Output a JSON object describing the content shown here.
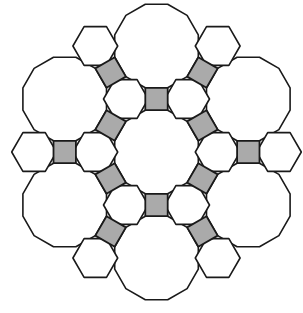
{
  "figure": {
    "vertex_configuration": "4.6.12",
    "edge_length": 22.4,
    "colors": {
      "stroke": "#1a1a1a",
      "square_fill": "#aaaaaa",
      "hexagon_fill": "#ffffff",
      "dodecagon_fill": "#ffffff",
      "background": "#ffffff"
    },
    "center": [
      156.5,
      152
    ],
    "dodecagons": [
      {
        "name": "center",
        "lattice": [
          0,
          0
        ]
      },
      {
        "name": "top",
        "angle_deg": 90
      },
      {
        "name": "upper-right",
        "angle_deg": 30
      },
      {
        "name": "lower-right",
        "angle_deg": -30
      },
      {
        "name": "bottom",
        "angle_deg": -90
      },
      {
        "name": "lower-left",
        "angle_deg": -150
      },
      {
        "name": "upper-left",
        "angle_deg": 150
      }
    ],
    "squares": [
      {
        "between": [
          "center",
          "top"
        ]
      },
      {
        "between": [
          "center",
          "upper-right"
        ]
      },
      {
        "between": [
          "center",
          "lower-right"
        ]
      },
      {
        "between": [
          "center",
          "bottom"
        ]
      },
      {
        "between": [
          "center",
          "lower-left"
        ]
      },
      {
        "between": [
          "center",
          "upper-left"
        ]
      },
      {
        "between": [
          "top",
          "upper-right"
        ]
      },
      {
        "between": [
          "upper-right",
          "lower-right"
        ]
      },
      {
        "between": [
          "lower-right",
          "bottom"
        ]
      },
      {
        "between": [
          "bottom",
          "lower-left"
        ]
      },
      {
        "between": [
          "lower-left",
          "upper-left"
        ]
      },
      {
        "between": [
          "upper-left",
          "top"
        ]
      }
    ],
    "hexagons": [
      {
        "between": [
          "center",
          "top",
          "upper-right"
        ]
      },
      {
        "between": [
          "center",
          "upper-right",
          "lower-right"
        ]
      },
      {
        "between": [
          "center",
          "lower-right",
          "bottom"
        ]
      },
      {
        "between": [
          "center",
          "bottom",
          "lower-left"
        ]
      },
      {
        "between": [
          "center",
          "lower-left",
          "upper-left"
        ]
      },
      {
        "between": [
          "center",
          "upper-left",
          "top"
        ]
      },
      {
        "outer_of": [
          "top",
          "upper-right"
        ]
      },
      {
        "outer_of": [
          "upper-right",
          "lower-right"
        ]
      },
      {
        "outer_of": [
          "lower-right",
          "bottom"
        ]
      },
      {
        "outer_of": [
          "bottom",
          "lower-left"
        ]
      },
      {
        "outer_of": [
          "lower-left",
          "upper-left"
        ]
      },
      {
        "outer_of": [
          "upper-left",
          "top"
        ]
      }
    ],
    "counts": {
      "dodecagons": 7,
      "squares": 12,
      "hexagons": 12
    }
  }
}
